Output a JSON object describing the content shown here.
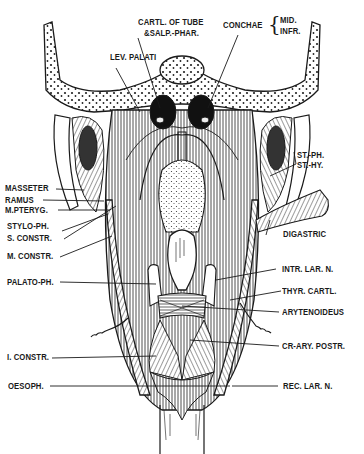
{
  "figure": {
    "background": "#ffffff",
    "ink": "#1a1a1a"
  },
  "labels": {
    "top": {
      "cartl_tube_1": "CARTL. OF TUBE",
      "cartl_tube_2": "&SALP.-PHAR.",
      "lev_palati": "LEV. PALATI",
      "conchae": "CONCHAE",
      "conchae_mid": "MID.",
      "conchae_infr": "INFR."
    },
    "left": [
      {
        "id": "masseter",
        "text": "MASSETER"
      },
      {
        "id": "ramus",
        "text": "RAMUS"
      },
      {
        "id": "m_pteryg",
        "text": "M.PTERYG."
      },
      {
        "id": "stylo_ph",
        "text": "STYLO-PH."
      },
      {
        "id": "s_constr",
        "text": "S. CONSTR."
      },
      {
        "id": "m_constr",
        "text": "M. CONSTR."
      },
      {
        "id": "palato_ph",
        "text": "PALATO-PH."
      },
      {
        "id": "i_constr",
        "text": "I. CONSTR."
      },
      {
        "id": "oesoph",
        "text": "OESOPH."
      }
    ],
    "right": [
      {
        "id": "st_ph",
        "text": "ST.-PH."
      },
      {
        "id": "st_hy",
        "text": "ST.-HY."
      },
      {
        "id": "digastric",
        "text": "DIGASTRIC"
      },
      {
        "id": "intr_lar_n",
        "text": "INTR. LAR. N."
      },
      {
        "id": "thyr_cartl",
        "text": "THYR. CARTL."
      },
      {
        "id": "arytenoideus",
        "text": "ARYTENOIDEUS"
      },
      {
        "id": "cr_ary_postr",
        "text": "CR-ARY. POSTR."
      },
      {
        "id": "rec_lar_n",
        "text": "REC. LAR. N."
      }
    ]
  }
}
